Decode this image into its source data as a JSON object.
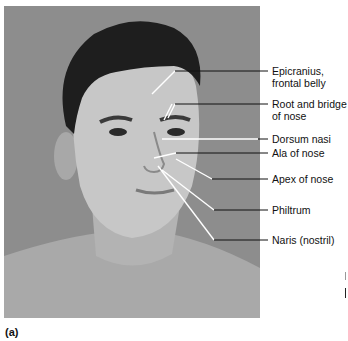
{
  "figure": {
    "panel_label": "(a)",
    "background_color": "#8d8d8d",
    "labels": [
      {
        "id": "epicranius",
        "lines": [
          "Epicranius,",
          "frontal belly"
        ],
        "y": 68
      },
      {
        "id": "root-bridge",
        "lines": [
          "Root and bridge",
          "of nose"
        ],
        "y": 100
      },
      {
        "id": "dorsum-nasi",
        "lines": [
          "Dorsum nasi"
        ],
        "y": 132
      },
      {
        "id": "ala",
        "lines": [
          "Ala of nose"
        ],
        "y": 148
      },
      {
        "id": "apex",
        "lines": [
          "Apex of nose"
        ],
        "y": 174
      },
      {
        "id": "philtrum",
        "lines": [
          "Philtrum"
        ],
        "y": 205
      },
      {
        "id": "naris",
        "lines": [
          "Naris (nostril)"
        ],
        "y": 236
      }
    ]
  }
}
